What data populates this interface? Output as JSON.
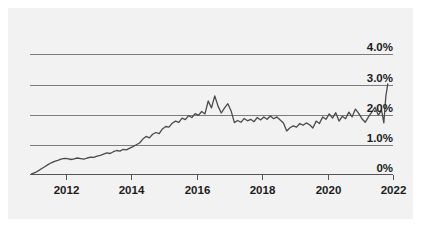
{
  "chart_data": {
    "type": "line",
    "title": "",
    "subtitle": "",
    "xlabel": "",
    "ylabel": "",
    "xlim": [
      2010.9,
      2022.0
    ],
    "ylim": [
      0,
      4.35
    ],
    "grid": true,
    "legend_position": "none",
    "y_ticks": [
      0,
      1.0,
      2.0,
      3.0,
      4.0
    ],
    "y_tick_labels": [
      "0%",
      "1.0%",
      "2.0%",
      "3.0%",
      "4.0%"
    ],
    "x_ticks": [
      2012,
      2014,
      2016,
      2018,
      2020,
      2022
    ],
    "x_tick_labels": [
      "2012",
      "2014",
      "2016",
      "2018",
      "2020",
      "2022"
    ],
    "series": [
      {
        "name": "rate",
        "color": "#4a4a4a",
        "x": [
          2010.95,
          2011.05,
          2011.15,
          2011.25,
          2011.35,
          2011.45,
          2011.55,
          2011.65,
          2011.75,
          2011.85,
          2011.95,
          2012.05,
          2012.15,
          2012.25,
          2012.35,
          2012.45,
          2012.55,
          2012.65,
          2012.75,
          2012.85,
          2012.95,
          2013.05,
          2013.15,
          2013.25,
          2013.35,
          2013.45,
          2013.55,
          2013.65,
          2013.75,
          2013.85,
          2013.95,
          2014.05,
          2014.15,
          2014.25,
          2014.35,
          2014.45,
          2014.55,
          2014.65,
          2014.75,
          2014.85,
          2014.95,
          2015.05,
          2015.15,
          2015.25,
          2015.35,
          2015.45,
          2015.55,
          2015.65,
          2015.75,
          2015.85,
          2015.95,
          2016.05,
          2016.15,
          2016.25,
          2016.35,
          2016.45,
          2016.55,
          2016.65,
          2016.75,
          2016.85,
          2016.95,
          2017.05,
          2017.15,
          2017.25,
          2017.35,
          2017.45,
          2017.55,
          2017.65,
          2017.75,
          2017.85,
          2017.95,
          2018.05,
          2018.15,
          2018.25,
          2018.35,
          2018.45,
          2018.55,
          2018.65,
          2018.75,
          2018.85,
          2018.95,
          2019.05,
          2019.15,
          2019.25,
          2019.35,
          2019.45,
          2019.55,
          2019.65,
          2019.75,
          2019.85,
          2019.95,
          2020.05,
          2020.15,
          2020.25,
          2020.35,
          2020.45,
          2020.55,
          2020.65,
          2020.75,
          2020.85,
          2020.95,
          2021.05,
          2021.15,
          2021.25,
          2021.35,
          2021.45,
          2021.55,
          2021.65,
          2021.72,
          2021.78,
          2021.84
        ],
        "y": [
          0.02,
          0.06,
          0.12,
          0.19,
          0.26,
          0.33,
          0.39,
          0.44,
          0.47,
          0.51,
          0.54,
          0.53,
          0.5,
          0.52,
          0.55,
          0.53,
          0.51,
          0.55,
          0.58,
          0.57,
          0.61,
          0.64,
          0.68,
          0.72,
          0.7,
          0.76,
          0.8,
          0.78,
          0.84,
          0.82,
          0.88,
          0.93,
          0.99,
          1.05,
          1.18,
          1.27,
          1.22,
          1.34,
          1.4,
          1.36,
          1.52,
          1.6,
          1.58,
          1.71,
          1.78,
          1.74,
          1.88,
          1.83,
          1.96,
          1.9,
          2.03,
          1.97,
          2.1,
          2.02,
          2.45,
          2.22,
          2.62,
          2.28,
          2.05,
          2.22,
          2.36,
          2.12,
          1.73,
          1.8,
          1.74,
          1.87,
          1.79,
          1.84,
          1.76,
          1.9,
          1.82,
          1.92,
          1.84,
          1.95,
          1.86,
          1.92,
          1.82,
          1.72,
          1.45,
          1.56,
          1.62,
          1.58,
          1.7,
          1.64,
          1.72,
          1.66,
          1.55,
          1.78,
          1.7,
          1.92,
          1.84,
          2.02,
          1.88,
          2.06,
          1.78,
          1.94,
          1.86,
          2.08,
          1.92,
          2.18,
          2.04,
          1.86,
          1.74,
          1.92,
          2.08,
          2.24,
          1.98,
          2.14,
          1.72,
          2.6,
          3.02
        ]
      }
    ]
  }
}
